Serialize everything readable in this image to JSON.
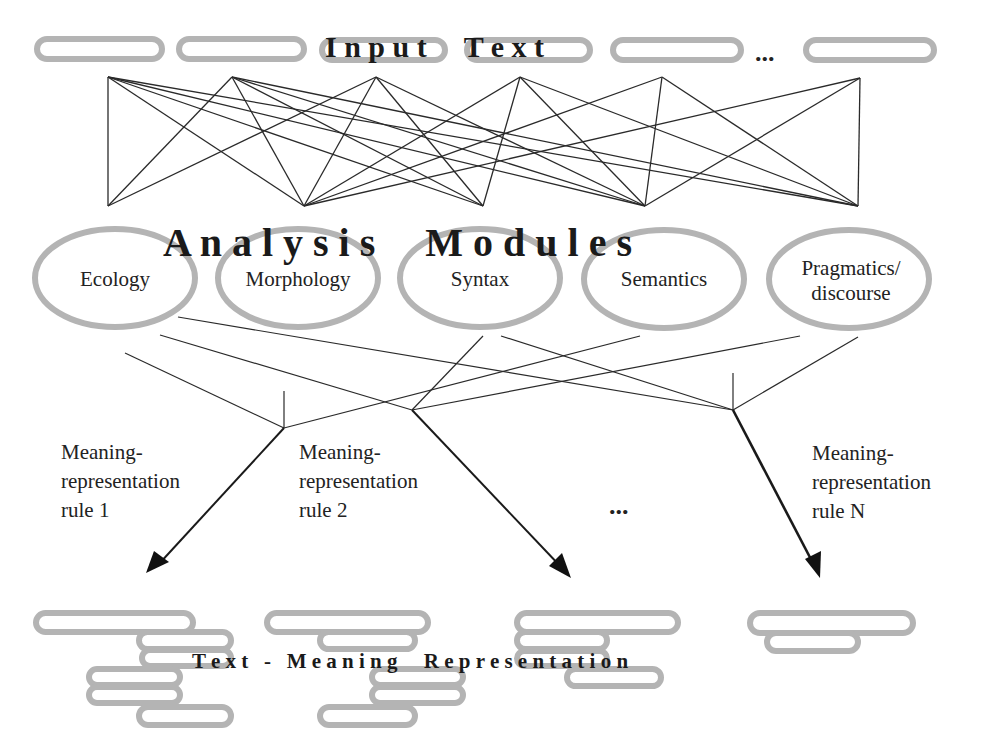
{
  "diagram": {
    "input": {
      "title": "I n p u t     T e x t",
      "ellipsis": "...",
      "pill_count": 6
    },
    "modules": {
      "title": "A n a l y s i s     M o d u l e s",
      "items": [
        {
          "label": "Ecology"
        },
        {
          "label": "Morphology"
        },
        {
          "label": "Syntax"
        },
        {
          "label": "Semantics"
        },
        {
          "label_line1": "Pragmatics/",
          "label_line2": "discourse"
        }
      ]
    },
    "rules": [
      {
        "line1": "Meaning-",
        "line2": "representation",
        "line3": "rule 1"
      },
      {
        "line1": "Meaning-",
        "line2": "representation",
        "line3": "rule 2"
      },
      {
        "line1": "Meaning-",
        "line2": "representation",
        "line3": "rule N"
      }
    ],
    "rules_ellipsis": "...",
    "output": {
      "title": "T e x t   -   M e a n i n g     R e p r e s e n t a t i o n"
    },
    "colors": {
      "shape_stroke": "#b4b4b4",
      "line": "#2a2a2a",
      "text": "#1a1a1a"
    }
  }
}
